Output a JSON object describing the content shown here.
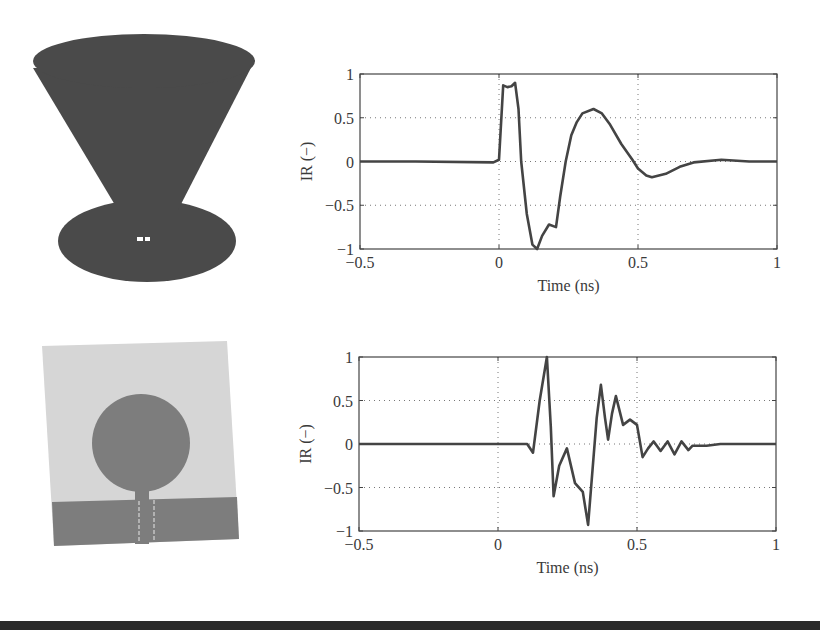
{
  "figure": {
    "panels": [
      {
        "antenna": "biconical-cone-over-disc",
        "antenna_color": "#4a4a4a",
        "feed_mark_color": "#ffffff"
      },
      {
        "antenna": "planar-circular-monopole",
        "substrate_color": "#d6d6d6",
        "patch_color": "#7d7d7d",
        "ground_color": "#7d7d7d"
      }
    ]
  },
  "chart_data": [
    {
      "type": "line",
      "title": "",
      "xlabel": "Time (ns)",
      "ylabel": "IR (−)",
      "xlim": [
        -0.5,
        1
      ],
      "ylim": [
        -1,
        1
      ],
      "xticks": [
        -0.5,
        0,
        0.5,
        1
      ],
      "xtick_labels": [
        "−0.5",
        "0",
        "0.5",
        "1"
      ],
      "yticks": [
        1,
        0.5,
        0,
        -0.5,
        -1
      ],
      "ytick_labels": [
        "1",
        "0.5",
        "0",
        "−0.5",
        "−1"
      ],
      "grid": "dotted",
      "legend": null,
      "series": [
        {
          "name": "impulse response (cone antenna)",
          "color": "#444444",
          "x": [
            -0.5,
            -0.3,
            -0.02,
            0.0,
            0.015,
            0.03,
            0.045,
            0.058,
            0.07,
            0.08,
            0.1,
            0.12,
            0.137,
            0.155,
            0.18,
            0.205,
            0.22,
            0.24,
            0.26,
            0.28,
            0.3,
            0.34,
            0.37,
            0.4,
            0.44,
            0.48,
            0.5,
            0.53,
            0.55,
            0.6,
            0.65,
            0.7,
            0.8,
            0.9,
            1.0
          ],
          "y": [
            0.0,
            0.0,
            -0.01,
            0.02,
            0.87,
            0.85,
            0.86,
            0.9,
            0.6,
            0.0,
            -0.6,
            -0.95,
            -1.0,
            -0.85,
            -0.72,
            -0.75,
            -0.4,
            0.0,
            0.3,
            0.45,
            0.55,
            0.6,
            0.55,
            0.42,
            0.2,
            0.02,
            -0.08,
            -0.16,
            -0.18,
            -0.14,
            -0.06,
            -0.01,
            0.02,
            0.0,
            0.0
          ]
        }
      ]
    },
    {
      "type": "line",
      "title": "",
      "xlabel": "Time (ns)",
      "ylabel": "IR (−)",
      "xlim": [
        -0.5,
        1
      ],
      "ylim": [
        -1,
        1
      ],
      "xticks": [
        -0.5,
        0,
        0.5,
        1
      ],
      "xtick_labels": [
        "−0.5",
        "0",
        "0.5",
        "1"
      ],
      "yticks": [
        1,
        0.5,
        0,
        -0.5,
        -1
      ],
      "ytick_labels": [
        "1",
        "0.5",
        "0",
        "−0.5",
        "−1"
      ],
      "grid": "dotted",
      "legend": null,
      "series": [
        {
          "name": "impulse response (planar monopole)",
          "color": "#444444",
          "x": [
            -0.5,
            -0.2,
            0.0,
            0.09,
            0.105,
            0.126,
            0.15,
            0.176,
            0.19,
            0.2,
            0.22,
            0.248,
            0.277,
            0.305,
            0.324,
            0.34,
            0.355,
            0.37,
            0.385,
            0.396,
            0.41,
            0.424,
            0.45,
            0.475,
            0.5,
            0.52,
            0.54,
            0.56,
            0.585,
            0.61,
            0.635,
            0.66,
            0.685,
            0.7,
            0.75,
            0.8,
            0.9,
            1.0
          ],
          "y": [
            0.0,
            0.0,
            0.0,
            0.0,
            0.0,
            -0.1,
            0.5,
            1.0,
            0.2,
            -0.6,
            -0.25,
            -0.05,
            -0.45,
            -0.55,
            -0.93,
            -0.3,
            0.3,
            0.68,
            0.3,
            0.05,
            0.35,
            0.55,
            0.22,
            0.28,
            0.22,
            -0.15,
            -0.05,
            0.03,
            -0.08,
            0.03,
            -0.12,
            0.03,
            -0.07,
            -0.02,
            -0.02,
            0.0,
            0.0,
            0.0
          ]
        }
      ]
    }
  ]
}
